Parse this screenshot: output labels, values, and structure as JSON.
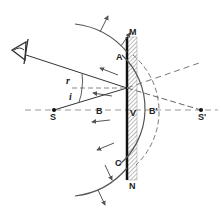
{
  "diagram": {
    "labels": {
      "M": "M",
      "N": "N",
      "A": "A",
      "C": "C",
      "B": "B",
      "V": "V",
      "B_prime": "B'",
      "S": "S",
      "S_prime": "S'",
      "angle_r": "r",
      "angle_i": "i"
    },
    "icons": [
      "eye-icon"
    ],
    "colors": {
      "line": "#333333",
      "dashed": "#888888",
      "mirror": "#111111",
      "hatch": "#777777"
    }
  }
}
